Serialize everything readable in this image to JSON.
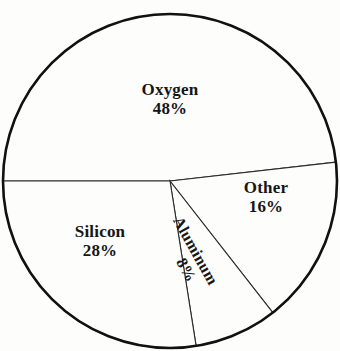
{
  "chart_data": {
    "type": "pie",
    "title": "",
    "subtitle": "",
    "xlabel": "",
    "ylabel": "",
    "legend_position": "none",
    "grid": false,
    "labels_inside_slices": true,
    "unit": "%",
    "categories": [
      "Oxygen",
      "Silicon",
      "Aluminum",
      "Other"
    ],
    "values": [
      48,
      28,
      8,
      16
    ],
    "slices": [
      {
        "name": "Oxygen",
        "label": "Oxygen",
        "value": 48,
        "value_label": "48%",
        "start_angle_deg": 180,
        "end_angle_deg": 353.5,
        "sweep_deg": 173.5,
        "fill": "#fdfdfc",
        "stroke": "#2b2b2b"
      },
      {
        "name": "Other",
        "label": "Other",
        "value": 16,
        "value_label": "16%",
        "start_angle_deg": 353.5,
        "end_angle_deg": 412,
        "sweep_deg": 58.5,
        "fill": "#fdfdfc",
        "stroke": "#2b2b2b"
      },
      {
        "name": "Aluminum",
        "label": "Aluminum",
        "value": 8,
        "value_label": "8%",
        "start_angle_deg": 52,
        "end_angle_deg": 81,
        "sweep_deg": 29,
        "fill": "#fdfdfc",
        "stroke": "#2b2b2b"
      },
      {
        "name": "Silicon",
        "label": "Silicon",
        "value": 28,
        "value_label": "28%",
        "start_angle_deg": 81,
        "end_angle_deg": 180,
        "sweep_deg": 99,
        "fill": "#fdfdfc",
        "stroke": "#2b2b2b"
      }
    ],
    "geometry": {
      "center_x": 170,
      "center_y": 181,
      "radius": 167,
      "outline_color": "#111111",
      "outline_width": 2.6,
      "divider_color": "#2b2b2b",
      "divider_width": 1.1,
      "background": "#fdfdfc"
    }
  },
  "labels": {
    "oxygen": {
      "name": "Oxygen",
      "value": "48%"
    },
    "other": {
      "name": "Other",
      "value": "16%"
    },
    "silicon": {
      "name": "Silicon",
      "value": "28%"
    },
    "aluminum": {
      "name": "Aluminum",
      "value": "8%"
    }
  }
}
